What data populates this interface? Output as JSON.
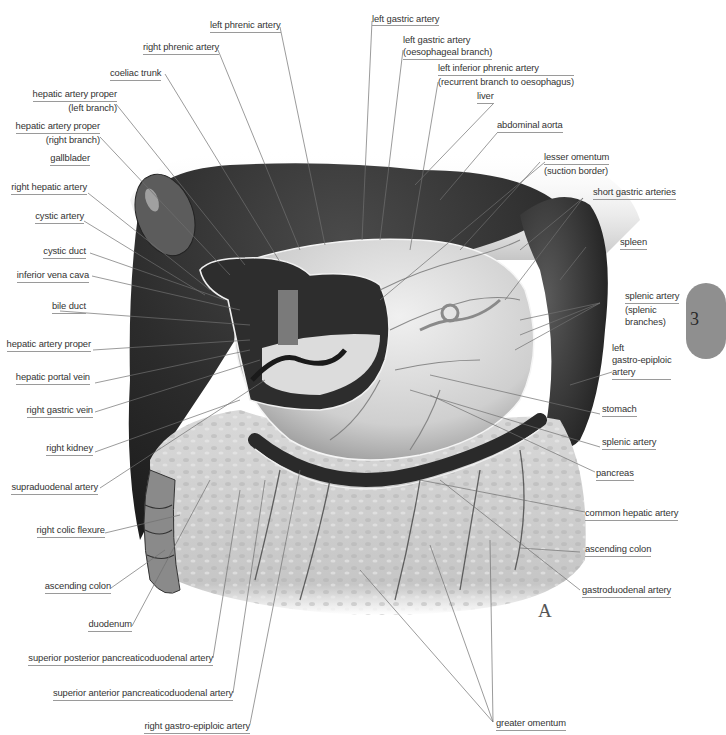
{
  "figure": {
    "panel_letter": "A",
    "page_tab": "3",
    "palette": {
      "background": "#ffffff",
      "liver_dark": "#2e2e2e",
      "stomach_light": "#d8d8d8",
      "omentum": "#cfcfcf",
      "leader_line": "#707070",
      "label_text": "#333333",
      "page_tab": "#8f8f8f"
    }
  },
  "labels_left": [
    {
      "id": "hepatic-artery-proper-left",
      "lines": [
        "hepatic artery proper",
        "(left branch)"
      ]
    },
    {
      "id": "hepatic-artery-proper-right",
      "lines": [
        "hepatic artery proper",
        "(right branch)"
      ]
    },
    {
      "id": "gallbladder",
      "lines": [
        "gallblader"
      ]
    },
    {
      "id": "right-hepatic-artery",
      "lines": [
        "right hepatic artery"
      ]
    },
    {
      "id": "cystic-artery",
      "lines": [
        "cystic artery"
      ]
    },
    {
      "id": "cystic-duct",
      "lines": [
        "cystic duct"
      ]
    },
    {
      "id": "inferior-vena-cava",
      "lines": [
        "inferior vena cava"
      ]
    },
    {
      "id": "bile-duct",
      "lines": [
        "bile duct"
      ]
    },
    {
      "id": "hepatic-artery-proper",
      "lines": [
        "hepatic artery proper"
      ]
    },
    {
      "id": "hepatic-portal-vein",
      "lines": [
        "hepatic portal vein"
      ]
    },
    {
      "id": "right-gastric-vein",
      "lines": [
        "right gastric vein"
      ]
    },
    {
      "id": "right-kidney",
      "lines": [
        "right kidney"
      ]
    },
    {
      "id": "supraduodenal-artery",
      "lines": [
        "supraduodenal artery"
      ]
    },
    {
      "id": "right-colic-flexure",
      "lines": [
        "right colic flexure"
      ]
    },
    {
      "id": "ascending-colon-left",
      "lines": [
        "ascending colon"
      ]
    },
    {
      "id": "duodenum",
      "lines": [
        "duodenum"
      ]
    },
    {
      "id": "superior-posterior-pancreaticoduodenal-artery",
      "lines": [
        "superior posterior pancreaticoduodenal artery"
      ]
    },
    {
      "id": "superior-anterior-pancreaticoduodenal-artery",
      "lines": [
        "superior anterior pancreaticoduodenal artery"
      ]
    },
    {
      "id": "right-gastro-epiploic-artery",
      "lines": [
        "right gastro-epiploic artery"
      ]
    }
  ],
  "labels_top": [
    {
      "id": "left-phrenic-artery",
      "lines": [
        "left phrenic artery"
      ]
    },
    {
      "id": "right-phrenic-artery",
      "lines": [
        "right phrenic artery"
      ]
    },
    {
      "id": "coeliac-trunk",
      "lines": [
        "coeliac trunk"
      ]
    },
    {
      "id": "left-gastric-artery",
      "lines": [
        "left gastric artery"
      ]
    },
    {
      "id": "left-gastric-artery-oesophageal",
      "lines": [
        "left gastric artery",
        "(oesophageal branch)"
      ]
    },
    {
      "id": "left-inferior-phrenic-artery",
      "lines": [
        "left inferior phrenic artery",
        "(recurrent branch to oesophagus)"
      ]
    },
    {
      "id": "liver",
      "lines": [
        "liver"
      ]
    },
    {
      "id": "abdominal-aorta",
      "lines": [
        "abdominal aorta"
      ]
    }
  ],
  "labels_right": [
    {
      "id": "lesser-omentum",
      "lines": [
        "lesser omentum",
        "(suction border)"
      ]
    },
    {
      "id": "short-gastric-arteries",
      "lines": [
        "short gastric arteries"
      ]
    },
    {
      "id": "spleen",
      "lines": [
        "spleen"
      ]
    },
    {
      "id": "splenic-artery-branches",
      "lines": [
        "splenic artery",
        "(splenic",
        "branches)"
      ]
    },
    {
      "id": "left-gastro-epiploic-artery",
      "lines": [
        "left",
        "gastro-epiploic",
        "artery"
      ]
    },
    {
      "id": "stomach",
      "lines": [
        "stomach"
      ]
    },
    {
      "id": "splenic-artery",
      "lines": [
        "splenic artery"
      ]
    },
    {
      "id": "pancreas",
      "lines": [
        "pancreas"
      ]
    },
    {
      "id": "common-hepatic-artery",
      "lines": [
        "common hepatic artery"
      ]
    },
    {
      "id": "ascending-colon-right",
      "lines": [
        "ascending colon"
      ]
    },
    {
      "id": "gastroduodenal-artery",
      "lines": [
        "gastroduodenal artery"
      ]
    },
    {
      "id": "greater-omentum",
      "lines": [
        "greater omentum"
      ]
    }
  ]
}
